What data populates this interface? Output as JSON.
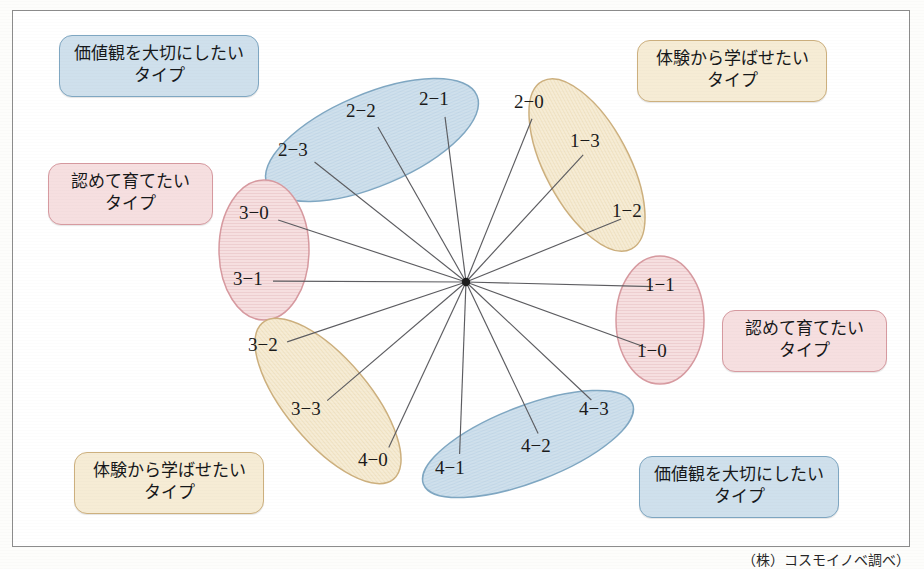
{
  "figure": {
    "type": "radial-node-diagram",
    "node_count": 16,
    "hub": {
      "x": 466,
      "y": 282
    }
  },
  "colors": {
    "blue_fill": "#cfe0ec",
    "blue_stroke": "#7fa7c2",
    "pink_fill": "#f6dfe0",
    "pink_stroke": "#d79aa0",
    "cream_fill": "#f6ecd5",
    "cream_stroke": "#cdb07e",
    "line": "#5c5c60",
    "frame": "#8c8c8c"
  },
  "nodes": [
    {
      "id": "n_2_1",
      "label": "2−1",
      "x": 443,
      "y": 101,
      "group": "blue_top"
    },
    {
      "id": "n_2_2",
      "label": "2−2",
      "x": 370,
      "y": 113,
      "group": "blue_top"
    },
    {
      "id": "n_2_3",
      "label": "2−3",
      "x": 302,
      "y": 152,
      "group": "blue_top"
    },
    {
      "id": "n_2_0",
      "label": "2−0",
      "x": 538,
      "y": 104,
      "group": "cream_topright"
    },
    {
      "id": "n_1_3",
      "label": "1−3",
      "x": 594,
      "y": 143,
      "group": "cream_topright"
    },
    {
      "id": "n_1_2",
      "label": "1−2",
      "x": 636,
      "y": 213,
      "group": "cream_topright"
    },
    {
      "id": "n_1_1",
      "label": "1−1",
      "x": 669,
      "y": 287,
      "group": "pink_right"
    },
    {
      "id": "n_1_0",
      "label": "1−0",
      "x": 661,
      "y": 353,
      "group": "pink_right"
    },
    {
      "id": "n_3_0",
      "label": "3−0",
      "x": 263,
      "y": 215,
      "group": "pink_left"
    },
    {
      "id": "n_3_1",
      "label": "3−1",
      "x": 257,
      "y": 281,
      "group": "pink_left"
    },
    {
      "id": "n_3_2",
      "label": "3−2",
      "x": 272,
      "y": 347,
      "group": "cream_bottomleft"
    },
    {
      "id": "n_3_3",
      "label": "3−3",
      "x": 315,
      "y": 411,
      "group": "cream_bottomleft"
    },
    {
      "id": "n_4_0",
      "label": "4−0",
      "x": 382,
      "y": 462,
      "group": "cream_bottomleft"
    },
    {
      "id": "n_4_1",
      "label": "4−1",
      "x": 459,
      "y": 470,
      "group": "blue_bottom"
    },
    {
      "id": "n_4_2",
      "label": "4−2",
      "x": 545,
      "y": 448,
      "group": "blue_bottom"
    },
    {
      "id": "n_4_3",
      "label": "4−3",
      "x": 603,
      "y": 411,
      "group": "blue_bottom"
    }
  ],
  "clusters": [
    {
      "id": "blue_top",
      "cx": 372,
      "cy": 140,
      "rx": 114,
      "ry": 46,
      "rotate": -23,
      "tone": "blue"
    },
    {
      "id": "cream_topright",
      "cx": 587,
      "cy": 165,
      "rx": 95,
      "ry": 42,
      "rotate": 62,
      "tone": "cream"
    },
    {
      "id": "pink_right",
      "cx": 660,
      "cy": 320,
      "rx": 44,
      "ry": 64,
      "rotate": 0,
      "tone": "pink"
    },
    {
      "id": "pink_left",
      "cx": 264,
      "cy": 250,
      "rx": 45,
      "ry": 70,
      "rotate": 0,
      "tone": "pink"
    },
    {
      "id": "cream_bottomleft",
      "cx": 328,
      "cy": 401,
      "rx": 102,
      "ry": 42,
      "rotate": 50,
      "tone": "cream"
    },
    {
      "id": "blue_bottom",
      "cx": 528,
      "cy": 444,
      "rx": 112,
      "ry": 38,
      "rotate": -21,
      "tone": "blue"
    }
  ],
  "callouts": [
    {
      "id": "callout-top-left",
      "tone": "blue",
      "line1": "価値観を大切にしたい",
      "line2": "タイプ",
      "x": 59,
      "y": 35,
      "w": 200,
      "h": 58
    },
    {
      "id": "callout-top-right",
      "tone": "cream",
      "line1": "体験から学ばせたい",
      "line2": "タイプ",
      "x": 637,
      "y": 40,
      "w": 190,
      "h": 58
    },
    {
      "id": "callout-left",
      "tone": "pink",
      "line1": "認めて育てたい",
      "line2": "タイプ",
      "x": 48,
      "y": 163,
      "w": 165,
      "h": 58
    },
    {
      "id": "callout-right",
      "tone": "pink",
      "line1": "認めて育てたい",
      "line2": "タイプ",
      "x": 722,
      "y": 310,
      "w": 165,
      "h": 58
    },
    {
      "id": "callout-bottom-left",
      "tone": "cream",
      "line1": "体験から学ばせたい",
      "line2": "タイプ",
      "x": 74,
      "y": 452,
      "w": 190,
      "h": 58
    },
    {
      "id": "callout-bottom-right",
      "tone": "blue",
      "line1": "価値観を大切にしたい",
      "line2": "タイプ",
      "x": 639,
      "y": 456,
      "w": 200,
      "h": 58
    }
  ],
  "footer": {
    "source_note": "（株）コスモイノベ調べ）"
  }
}
